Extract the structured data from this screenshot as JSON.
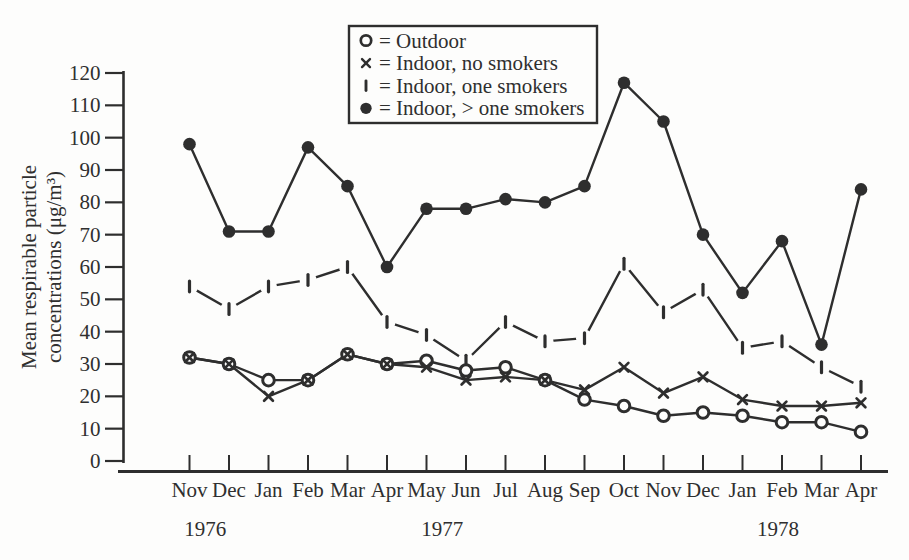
{
  "chart_data": {
    "type": "line",
    "title": "",
    "ylabel_lines": [
      "Mean respirable particle",
      "concentrations (μg/m³)"
    ],
    "ylim": [
      0,
      120
    ],
    "ytick_step": 10,
    "ytick_labels": [
      "0",
      "10",
      "20",
      "30",
      "40",
      "50",
      "60",
      "70",
      "80",
      "90",
      "100",
      "110",
      "120"
    ],
    "categories": [
      "Nov",
      "Dec",
      "Jan",
      "Feb",
      "Mar",
      "Apr",
      "May",
      "Jun",
      "Jul",
      "Aug",
      "Sep",
      "Oct",
      "Nov",
      "Dec",
      "Jan",
      "Feb",
      "Mar",
      "Apr"
    ],
    "year_labels": [
      {
        "label": "1976",
        "month_index": 0.4
      },
      {
        "label": "1977",
        "month_index": 6.4
      },
      {
        "label": "1978",
        "month_index": 14.9
      }
    ],
    "series": [
      {
        "name": "Outdoor",
        "marker": "open-circle",
        "values": [
          32,
          30,
          25,
          25,
          33,
          30,
          31,
          28,
          29,
          25,
          19,
          17,
          14,
          15,
          14,
          12,
          12,
          9
        ]
      },
      {
        "name": "Indoor, no smokers",
        "marker": "x",
        "values": [
          32,
          30,
          20,
          25,
          33,
          30,
          29,
          25,
          26,
          25,
          22,
          29,
          21,
          26,
          19,
          17,
          17,
          18
        ]
      },
      {
        "name": "Indoor, one smokers",
        "marker": "vbar",
        "values": [
          54,
          47,
          54,
          56,
          60,
          43,
          39,
          31,
          43,
          37,
          38,
          61,
          46,
          53,
          35,
          37,
          29,
          23
        ]
      },
      {
        "name": "Indoor, > one smokers",
        "marker": "filled-circle",
        "values": [
          98,
          71,
          71,
          97,
          85,
          60,
          78,
          78,
          81,
          80,
          85,
          117,
          105,
          70,
          52,
          68,
          36,
          84
        ]
      }
    ],
    "legend": {
      "position": "top-center",
      "entries": [
        {
          "marker": "open-circle",
          "label": "= Outdoor"
        },
        {
          "marker": "x",
          "label": "= Indoor, no smokers"
        },
        {
          "marker": "vbar",
          "label": "= Indoor, one smokers"
        },
        {
          "marker": "filled-circle",
          "label": "= Indoor, > one smokers"
        }
      ]
    },
    "grid": "off",
    "x_axis_years_shown": [
      "1976",
      "1977",
      "1978"
    ]
  },
  "colors": {
    "ink": "#2e2e2e",
    "paper": "#fdfdfc"
  }
}
